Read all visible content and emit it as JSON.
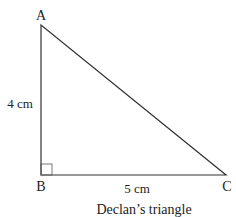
{
  "diagram": {
    "type": "right-triangle",
    "vertices": {
      "A": {
        "label": "A",
        "x": 41,
        "y": 25
      },
      "B": {
        "label": "B",
        "x": 41,
        "y": 175
      },
      "C": {
        "label": "C",
        "x": 226,
        "y": 175
      }
    },
    "sides": {
      "AB": {
        "label": "4 cm"
      },
      "BC": {
        "label": "5 cm"
      }
    },
    "right_angle_at": "B",
    "caption": "Declan’s triangle",
    "stroke_color": "#333333"
  }
}
